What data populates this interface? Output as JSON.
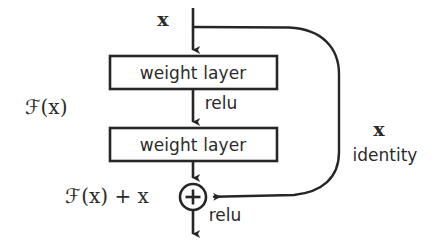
{
  "figure": {
    "type": "diagram",
    "background_color": "#ffffff",
    "stroke_color": "#262626",
    "text_color": "#2b2b2b"
  },
  "labels": {
    "input": "x",
    "function_branch": "ℱ(x)",
    "output_sum": "ℱ(x) + x",
    "skip_var": "x",
    "skip_name": "identity",
    "relu_mid": "relu",
    "relu_out": "relu",
    "plus_symbol": "+"
  },
  "blocks": [
    {
      "label": "weight layer",
      "x": 110,
      "y": 56,
      "width": 167,
      "height": 33
    },
    {
      "label": "weight layer",
      "x": 110,
      "y": 128,
      "width": 167,
      "height": 33
    }
  ],
  "nodes": {
    "adder": {
      "cx": 193,
      "cy": 197,
      "r": 13
    }
  },
  "edges": [
    {
      "name": "input-to-block1",
      "from": [
        193,
        8
      ],
      "to": [
        193,
        56
      ]
    },
    {
      "name": "block1-to-block2",
      "from": [
        193,
        89
      ],
      "to": [
        193,
        128
      ]
    },
    {
      "name": "block2-to-adder",
      "from": [
        193,
        161
      ],
      "to": [
        193,
        184
      ]
    },
    {
      "name": "adder-to-output",
      "from": [
        193,
        210
      ],
      "to": [
        193,
        240
      ]
    },
    {
      "name": "identity-skip",
      "from": [
        193,
        27
      ],
      "to": [
        207,
        197
      ]
    }
  ],
  "label_positions": {
    "input": [
      163,
      19
    ],
    "function_branch": [
      46,
      107
    ],
    "output_sum": [
      107,
      196
    ],
    "skip_var": [
      379,
      129
    ],
    "skip_name": [
      385,
      155
    ],
    "relu_mid": [
      221,
      103
    ],
    "relu_out": [
      225,
      215
    ]
  }
}
